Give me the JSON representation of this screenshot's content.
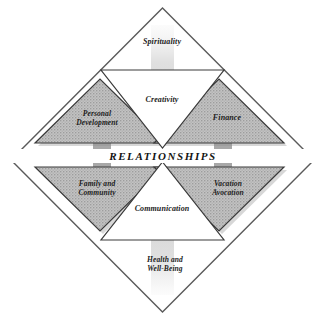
{
  "diagram": {
    "center": {
      "label": "RELATIONSHIPS"
    },
    "outer_labels": [
      {
        "key": "spirituality",
        "label": "Spirituality",
        "position": "top"
      },
      {
        "key": "health_wellbeing",
        "label": "Health and\nWell-Being",
        "position": "bottom"
      }
    ],
    "triangles": [
      {
        "key": "personal_development",
        "label": "Personal\nDevelopment",
        "position": "left-upper",
        "fill": "gray",
        "direction": "up"
      },
      {
        "key": "finance",
        "label": "Finance",
        "position": "right-upper",
        "fill": "gray",
        "direction": "up"
      },
      {
        "key": "family_community",
        "label": "Family and\nCommunity",
        "position": "left-lower",
        "fill": "gray",
        "direction": "down"
      },
      {
        "key": "vacation_avocation",
        "label": "Vacation\nAvocation",
        "position": "right-lower",
        "fill": "gray",
        "direction": "down"
      },
      {
        "key": "creativity",
        "label": "Creativity",
        "position": "top-center",
        "fill": "white",
        "direction": "down"
      },
      {
        "key": "communication",
        "label": "Communication",
        "position": "bottom-center",
        "fill": "white",
        "direction": "up"
      }
    ],
    "arrows": [
      {
        "key": "arrow-down",
        "direction": "down",
        "from": "spirituality",
        "to": "center"
      },
      {
        "key": "arrow-up",
        "direction": "up",
        "from": "health_wellbeing",
        "to": "center"
      }
    ],
    "colors": {
      "outline": "#555555",
      "triangle_fill": "#b9b9b9",
      "triangle_stroke": "#3a3a3a",
      "white_fill": "#ffffff",
      "arrow_fill": "#d9d9d9",
      "connector_fill": "#a9a9a9",
      "text": "#1c1c1c",
      "background": "#ffffff"
    }
  }
}
